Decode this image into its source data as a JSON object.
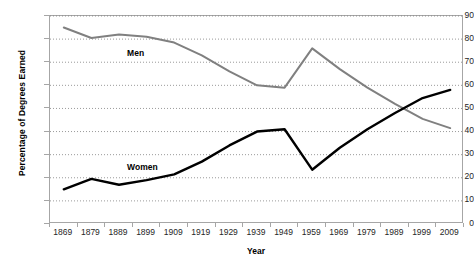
{
  "chart_data": {
    "type": "line",
    "title": "",
    "xlabel": "Year",
    "ylabel": "Percentage of Degrees Earned",
    "categories": [
      1869,
      1879,
      1889,
      1899,
      1909,
      1919,
      1929,
      1939,
      1949,
      1959,
      1969,
      1979,
      1989,
      1999,
      2009
    ],
    "xtick_labels": [
      "1869",
      "1879",
      "1889",
      "1899",
      "1909",
      "1919",
      "1929",
      "1939",
      "1949",
      "1959",
      "1969",
      "1979",
      "1989",
      "1999",
      "2009"
    ],
    "ytick_labels": [
      "0",
      "10",
      "20",
      "30",
      "40",
      "50",
      "60",
      "70",
      "80",
      "90"
    ],
    "ylim": [
      0,
      90
    ],
    "ytick_step": 10,
    "grid": true,
    "grid_style": "dotted-horizontal",
    "legend": "inline-labels",
    "series": [
      {
        "name": "Men",
        "color": "#808080",
        "label_x": 1897,
        "label_y": 74,
        "values": [
          85,
          80.5,
          82,
          81,
          78.5,
          73,
          66,
          60,
          59,
          76,
          67,
          59,
          52,
          45.5,
          41.5
        ]
      },
      {
        "name": "Women",
        "color": "#000000",
        "label_x": 1897,
        "label_y": 24.5,
        "values": [
          15,
          19.5,
          17,
          19,
          21.5,
          27,
          34,
          40,
          41,
          23.5,
          33,
          41,
          48,
          54.5,
          58
        ]
      }
    ]
  },
  "colors": {
    "men_line": "#808080",
    "women_line": "#000000",
    "axis": "#a6a6a6",
    "grid": "#808080",
    "text": "#262626",
    "background": "#ffffff"
  }
}
